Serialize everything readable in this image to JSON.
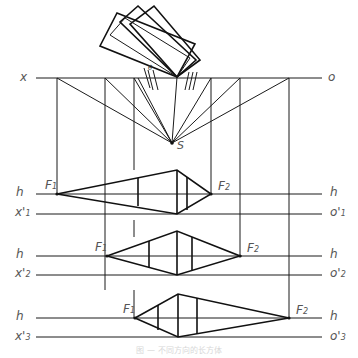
{
  "diagram": {
    "type": "perspective construction",
    "top_labels": {
      "left": "x",
      "right": "o",
      "station_point": "S",
      "angle": "θ"
    },
    "rows": [
      {
        "h_left": "h",
        "h_right": "h",
        "x_label": "x'",
        "x_sub": "1",
        "o_label": "o'",
        "o_sub": "1",
        "f1": "F",
        "f1_sub": "1",
        "f2": "F",
        "f2_sub": "2"
      },
      {
        "h_left": "h",
        "h_right": "h",
        "x_label": "x'",
        "x_sub": "2",
        "o_label": "o'",
        "o_sub": "2",
        "f1": "F",
        "f1_sub": "1",
        "f2": "F",
        "f2_sub": "2"
      },
      {
        "h_left": "h",
        "h_right": "h",
        "x_label": "x'",
        "x_sub": "3",
        "o_label": "o'",
        "o_sub": "3",
        "f1": "F",
        "f1_sub": "1",
        "f2": "F",
        "f2_sub": "2"
      }
    ],
    "caption": "图 — 不同方向的长方体"
  }
}
